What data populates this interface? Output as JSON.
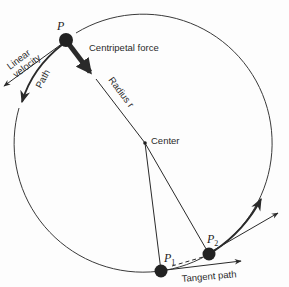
{
  "diagram": {
    "colors": {
      "ink": "#2a2a2a",
      "background": "#fdfdfd"
    },
    "circle": {
      "cx": 145,
      "cy": 143,
      "r": 129
    },
    "points": {
      "p": {
        "label": "P",
        "x": 66,
        "y": 40
      },
      "p1": {
        "label": "P",
        "subscript": "1",
        "x": 161,
        "y": 271
      },
      "p2": {
        "label": "P",
        "subscript": "2",
        "x": 209,
        "y": 254
      },
      "center": {
        "label": "Center",
        "x": 145,
        "y": 143
      }
    },
    "labels": {
      "centripetal_force": "Centripetal force",
      "radius": "Radius r",
      "linear_velocity_line1": "Linear",
      "linear_velocity_line2": "velocity",
      "path": "Path",
      "center": "Center",
      "tangent_path": "Tangent path"
    }
  }
}
